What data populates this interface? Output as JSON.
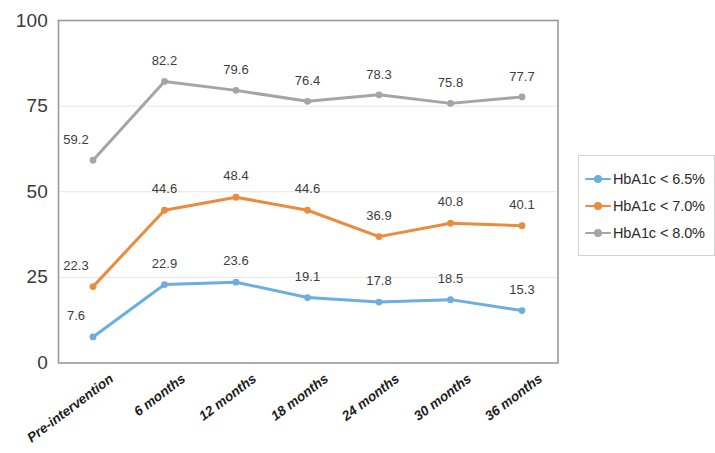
{
  "chart_data": {
    "type": "line",
    "title": "",
    "subtitle": "",
    "xlabel": "",
    "ylabel": "",
    "ylim": [
      0,
      100
    ],
    "yticks": [
      0,
      25,
      50,
      75,
      100
    ],
    "grid": true,
    "legend_position": "right",
    "categories": [
      "Pre-intervention",
      "6 months",
      "12 months",
      "18 months",
      "24 months",
      "30 months",
      "36 months"
    ],
    "series": [
      {
        "name": "HbA1c < 6.5%",
        "color": "#6BAEE0",
        "values": [
          7.6,
          22.9,
          23.6,
          19.1,
          17.8,
          18.5,
          15.3
        ],
        "labels": [
          "7.6",
          "22.9",
          "23.6",
          "19.1",
          "17.8",
          "18.5",
          "15.3"
        ]
      },
      {
        "name": "HbA1c < 7.0%",
        "color": "#ED8B3C",
        "values": [
          22.3,
          44.6,
          48.4,
          44.6,
          36.9,
          40.8,
          40.1
        ],
        "labels": [
          "22.3",
          "44.6",
          "48.4",
          "44.6",
          "36.9",
          "40.8",
          "40.1"
        ]
      },
      {
        "name": "HbA1c < 8.0%",
        "color": "#A5A5A5",
        "values": [
          59.2,
          82.2,
          79.6,
          76.4,
          78.3,
          75.8,
          77.7
        ],
        "labels": [
          "59.2",
          "82.2",
          "79.6",
          "76.4",
          "78.3",
          "75.8",
          "77.7"
        ]
      }
    ]
  },
  "axis": {
    "y_tick_labels": [
      "100",
      "75",
      "50",
      "25",
      "0"
    ],
    "x_tick_labels": [
      "Pre-intervention",
      "6 months",
      "12 months",
      "18 months",
      "24 months",
      "30 months",
      "36 months"
    ]
  },
  "legend": {
    "items": [
      {
        "label": "HbA1c < 6.5%",
        "color": "#6BAEE0"
      },
      {
        "label": "HbA1c < 7.0%",
        "color": "#ED8B3C"
      },
      {
        "label": "HbA1c < 8.0%",
        "color": "#A5A5A5"
      }
    ]
  },
  "style": {
    "plot_border_color": "#9a9a9a",
    "gridline_color": "#e8e4e4",
    "background": "#ffffff"
  }
}
